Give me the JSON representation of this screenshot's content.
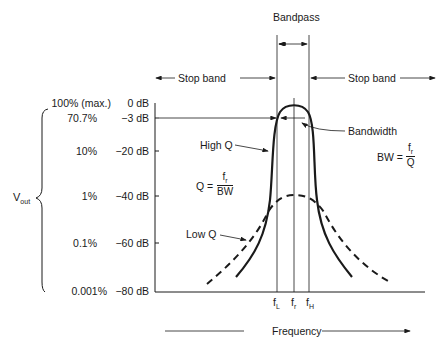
{
  "title": "Bandpass",
  "stop_band_left": "Stop band",
  "stop_band_right": "Stop band",
  "vout_label": "V",
  "vout_sub": "out",
  "percent_ticks": [
    "100% (max.)",
    "70.7%",
    "10%",
    "1%",
    "0.1%",
    "0.001%"
  ],
  "db_ticks": [
    "0 dB",
    "−3 dB",
    "−20 dB",
    "−40 dB",
    "−60 dB",
    "−80 dB"
  ],
  "curves": {
    "high_q": "High Q",
    "low_q": "Low Q"
  },
  "bandwidth_label": "Bandwidth",
  "bw_formula": {
    "lhs": "BW =",
    "num": "f",
    "num_sub": "r",
    "den": "Q"
  },
  "q_formula": {
    "lhs": "Q =",
    "num": "f",
    "num_sub": "r",
    "den": "BW"
  },
  "freq_marks": {
    "fl": "f",
    "fl_sub": "L",
    "fr": "f",
    "fr_sub": "r",
    "fh": "f",
    "fh_sub": "H"
  },
  "x_axis_label": "Frequency",
  "colors": {
    "ink": "#1a1a1a",
    "background": "#ffffff"
  }
}
